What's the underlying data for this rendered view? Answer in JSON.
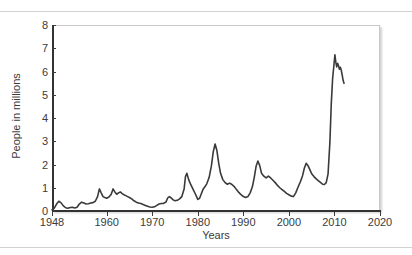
{
  "figure": {
    "xlabel": "Years",
    "ylabel": "People in millions",
    "line_color": "#3a3a3a",
    "frame_color": "#c9c9c9",
    "axis_color": "#333333",
    "background": "#ffffff"
  },
  "chart_data": {
    "type": "line",
    "title": "",
    "subtitle": "",
    "xlabel": "Years",
    "ylabel": "People in millions",
    "xlim": [
      1948,
      2020
    ],
    "ylim": [
      0,
      8
    ],
    "xticks": [
      1948,
      1960,
      1970,
      1980,
      1990,
      2000,
      2010,
      2020
    ],
    "xtick_labels": [
      "1948",
      "1960",
      "1970",
      "1980",
      "1990",
      "2000",
      "2010",
      "2020"
    ],
    "yticks": [
      0,
      1,
      2,
      3,
      4,
      5,
      6,
      7,
      8
    ],
    "ytick_labels": [
      "0",
      "1",
      "2",
      "3",
      "4",
      "5",
      "6",
      "7",
      "8"
    ],
    "grid": false,
    "legend": null,
    "legend_position": "none",
    "annotations": [],
    "series": [
      {
        "name": "People in millions",
        "color": "#3a3a3a",
        "x": [
          1948.0,
          1948.5,
          1949.0,
          1949.5,
          1950.0,
          1950.5,
          1951.0,
          1951.5,
          1952.0,
          1952.5,
          1953.0,
          1953.5,
          1954.0,
          1954.5,
          1955.0,
          1955.5,
          1956.0,
          1956.5,
          1957.0,
          1957.5,
          1958.0,
          1958.4,
          1958.8,
          1959.2,
          1959.6,
          1960.0,
          1960.5,
          1961.0,
          1961.4,
          1961.8,
          1962.2,
          1962.6,
          1963.0,
          1963.4,
          1963.8,
          1964.2,
          1964.6,
          1965.0,
          1965.5,
          1966.0,
          1966.5,
          1967.0,
          1967.5,
          1968.0,
          1968.5,
          1969.0,
          1969.5,
          1970.0,
          1970.5,
          1971.0,
          1971.5,
          1972.0,
          1972.5,
          1973.0,
          1973.4,
          1973.8,
          1974.2,
          1974.6,
          1975.0,
          1975.5,
          1976.0,
          1976.5,
          1977.0,
          1977.3,
          1977.6,
          1978.0,
          1978.5,
          1979.0,
          1979.5,
          1980.0,
          1980.4,
          1980.8,
          1981.2,
          1981.6,
          1982.0,
          1982.5,
          1983.0,
          1983.4,
          1983.8,
          1984.2,
          1984.6,
          1985.0,
          1985.5,
          1986.0,
          1986.5,
          1987.0,
          1987.5,
          1988.0,
          1988.5,
          1989.0,
          1989.5,
          1990.0,
          1990.5,
          1991.0,
          1991.5,
          1992.0,
          1992.4,
          1992.8,
          1993.2,
          1993.6,
          1994.0,
          1994.5,
          1995.0,
          1995.5,
          1996.0,
          1996.5,
          1997.0,
          1997.5,
          1998.0,
          1998.5,
          1999.0,
          1999.5,
          2000.0,
          2000.5,
          2001.0,
          2001.5,
          2002.0,
          2002.5,
          2003.0,
          2003.4,
          2003.8,
          2004.2,
          2004.6,
          2005.0,
          2005.5,
          2006.0,
          2006.5,
          2007.0,
          2007.4,
          2007.8,
          2008.2,
          2008.6,
          2009.0,
          2009.3,
          2009.6,
          2009.9,
          2010.1,
          2010.3,
          2010.5,
          2010.7,
          2010.9,
          2011.1,
          2011.3,
          2011.5,
          2011.7,
          2011.9,
          2012.1
        ],
        "y": [
          0.05,
          0.12,
          0.3,
          0.42,
          0.35,
          0.22,
          0.14,
          0.12,
          0.15,
          0.16,
          0.13,
          0.16,
          0.3,
          0.38,
          0.34,
          0.3,
          0.31,
          0.34,
          0.36,
          0.42,
          0.62,
          0.95,
          0.78,
          0.62,
          0.58,
          0.55,
          0.6,
          0.72,
          0.95,
          0.82,
          0.72,
          0.78,
          0.82,
          0.75,
          0.7,
          0.66,
          0.62,
          0.58,
          0.52,
          0.44,
          0.38,
          0.34,
          0.32,
          0.28,
          0.24,
          0.2,
          0.17,
          0.16,
          0.18,
          0.24,
          0.3,
          0.32,
          0.33,
          0.38,
          0.56,
          0.62,
          0.55,
          0.48,
          0.44,
          0.46,
          0.52,
          0.62,
          0.95,
          1.48,
          1.62,
          1.35,
          1.12,
          0.92,
          0.72,
          0.5,
          0.55,
          0.75,
          0.95,
          1.05,
          1.18,
          1.45,
          1.95,
          2.55,
          2.88,
          2.6,
          2.05,
          1.62,
          1.35,
          1.22,
          1.15,
          1.2,
          1.14,
          1.05,
          0.92,
          0.8,
          0.7,
          0.62,
          0.58,
          0.62,
          0.78,
          1.05,
          1.45,
          1.92,
          2.15,
          1.95,
          1.62,
          1.5,
          1.42,
          1.5,
          1.42,
          1.32,
          1.22,
          1.1,
          1.0,
          0.92,
          0.84,
          0.76,
          0.7,
          0.64,
          0.62,
          0.78,
          1.02,
          1.25,
          1.52,
          1.85,
          2.05,
          1.95,
          1.78,
          1.6,
          1.48,
          1.38,
          1.3,
          1.22,
          1.15,
          1.14,
          1.22,
          1.6,
          2.95,
          4.6,
          5.7,
          6.3,
          6.72,
          6.4,
          6.2,
          6.35,
          6.25,
          6.1,
          6.18,
          6.05,
          5.85,
          5.62,
          5.5
        ]
      }
    ]
  }
}
